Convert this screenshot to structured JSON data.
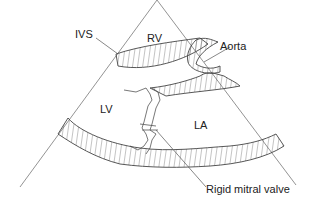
{
  "diagram": {
    "labels": {
      "ivs": "IVS",
      "rv": "RV",
      "aorta": "Aorta",
      "lv": "LV",
      "la": "LA",
      "mitral": "Rigid mitral valve"
    },
    "colors": {
      "line": "#555555",
      "background": "#ffffff",
      "text": "#222222"
    }
  }
}
